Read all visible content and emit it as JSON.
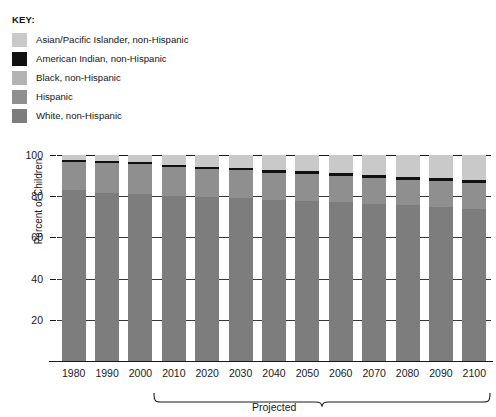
{
  "legend": {
    "title": "KEY:",
    "items": [
      {
        "label": "Asian/Pacific Islander, non-Hispanic",
        "color": "#c9c9c9",
        "key": "asian"
      },
      {
        "label": "American Indian, non-Hispanic",
        "color": "#111111",
        "key": "american_indian"
      },
      {
        "label": "Black, non-Hispanic",
        "color": "#b3b3b3",
        "key": "black"
      },
      {
        "label": "Hispanic",
        "color": "#8f8f8f",
        "key": "hispanic"
      },
      {
        "label": "White, non-Hispanic",
        "color": "#7d7d7d",
        "key": "white"
      }
    ]
  },
  "axes": {
    "ylabel": "Percent of Children",
    "yticks": [
      20,
      40,
      60,
      80,
      100
    ],
    "ylim": [
      0,
      100
    ],
    "projected_label": "Projected",
    "projected_from": "2010",
    "projected_to": "2100"
  },
  "chart_data": {
    "type": "bar",
    "title": "",
    "subtitle": "",
    "stacked": true,
    "xlabel": "",
    "ylabel": "Percent of Children",
    "ylim": [
      0,
      100
    ],
    "yticks": [
      20,
      40,
      60,
      80,
      100
    ],
    "grid": true,
    "legend_position": "top-left",
    "categories": [
      "1980",
      "1990",
      "2000",
      "2010",
      "2020",
      "2030",
      "2040",
      "2050",
      "2060",
      "2070",
      "2080",
      "2090",
      "2100"
    ],
    "series": [
      {
        "name": "White, non-Hispanic",
        "color": "#7d7d7d",
        "values": [
          83.0,
          81.5,
          81.0,
          80.0,
          79.5,
          79.0,
          78.0,
          77.5,
          77.0,
          76.0,
          75.5,
          75.0,
          74.0
        ]
      },
      {
        "name": "Hispanic",
        "color": "#8f8f8f",
        "values": [
          13.5,
          14.5,
          14.5,
          14.0,
          13.5,
          13.5,
          13.5,
          13.5,
          13.0,
          13.0,
          12.5,
          12.5,
          12.5
        ]
      },
      {
        "name": "Black, non-Hispanic",
        "color": "#b3b3b3",
        "values": [
          0.0,
          0.0,
          0.0,
          0.0,
          0.0,
          0.0,
          0.0,
          0.0,
          0.0,
          0.0,
          0.0,
          0.0,
          0.0
        ]
      },
      {
        "name": "American Indian, non-Hispanic",
        "color": "#111111",
        "values": [
          1.2,
          1.2,
          1.2,
          1.2,
          1.2,
          1.2,
          1.2,
          1.2,
          1.2,
          1.2,
          1.2,
          1.2,
          1.2
        ]
      },
      {
        "name": "Asian/Pacific Islander, non-Hispanic",
        "color": "#c9c9c9",
        "values": [
          2.3,
          2.8,
          3.3,
          4.8,
          5.8,
          6.3,
          7.3,
          7.8,
          8.8,
          9.8,
          10.8,
          11.3,
          12.3
        ]
      }
    ]
  }
}
